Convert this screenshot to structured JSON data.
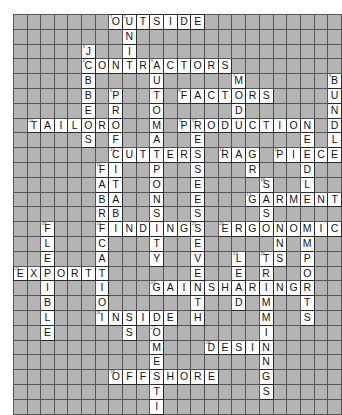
{
  "puzzle": {
    "kind": "crossword-grid",
    "columns": 24,
    "rows": 27,
    "cell_background_empty": "#b4b4b4",
    "cell_background_filled": "#ffffff",
    "grid_line_color": "#56565a",
    "letter_color": "#141414",
    "answers_across": [
      {
        "number": 1,
        "text": "OUTSIDE",
        "row": 0,
        "col": 7
      },
      {
        "number": 4,
        "text": "CONTRACTORS",
        "row": 3,
        "col": 5
      },
      {
        "number": 8,
        "text": "FACTORS",
        "row": 5,
        "col": 10
      },
      {
        "number": 10,
        "text": "TAILOR",
        "row": 7,
        "col": 1
      },
      {
        "number": 11,
        "text": "PRODUCTION",
        "row": 7,
        "col": 12
      },
      {
        "number": 13,
        "text": "CUTTERS",
        "row": 9,
        "col": 8
      },
      {
        "number": 14,
        "text": "RAG",
        "row": 9,
        "col": 16
      },
      {
        "number": 15,
        "text": "PIECE",
        "row": 9,
        "col": 19
      },
      {
        "number": 17,
        "text": "GARMENT",
        "row": 12,
        "col": 17
      },
      {
        "number": 19,
        "text": "FINDINGS",
        "row": 14,
        "col": 6
      },
      {
        "number": 20,
        "text": "ERGONOMICS",
        "row": 14,
        "col": 14
      },
      {
        "number": 22,
        "text": "EXPORT",
        "row": 17,
        "col": 0
      },
      {
        "number": 24,
        "text": "GAINSHARING",
        "row": 19,
        "col": 10
      },
      {
        "number": 26,
        "text": "INSIDE",
        "row": 21,
        "col": 5
      },
      {
        "number": 28,
        "text": "DESIGN",
        "row": 23,
        "col": 13
      },
      {
        "number": 29,
        "text": "OFFSHORE",
        "row": 24,
        "col": 6
      },
      {
        "number": 30,
        "text": "CONSULTANTS",
        "row": 26,
        "col": 8
      }
    ],
    "answers_down": [
      {
        "number": 1,
        "text": "OMA",
        "row": 0,
        "col": 7
      },
      {
        "number": 2,
        "text": "UNIT",
        "row": 0,
        "col": 8
      },
      {
        "number": 3,
        "text": "JOBBERS",
        "row": 2,
        "col": 5
      },
      {
        "number": 5,
        "text": "AUTOMATION",
        "row": 3,
        "col": 10
      },
      {
        "number": 6,
        "text": "PROFITABILITY",
        "row": 5,
        "col": 7
      },
      {
        "number": 7,
        "text": "MODULE",
        "row": 5,
        "col": 14
      },
      {
        "number": 9,
        "text": "BUNDLE",
        "row": 5,
        "col": 23
      },
      {
        "number": 12,
        "text": "RESPONSE",
        "row": 7,
        "col": 13
      },
      {
        "number": 16,
        "text": "SECTION",
        "row": 9,
        "col": 19
      },
      {
        "number": 18,
        "text": "SEAMS",
        "row": 11,
        "col": 18
      },
      {
        "number": 19,
        "text": "FLEXIBLE",
        "row": 14,
        "col": 2
      },
      {
        "number": 21,
        "text": "SEVENTH",
        "row": 14,
        "col": 13
      },
      {
        "number": 23,
        "text": "LEAD",
        "row": 16,
        "col": 11
      },
      {
        "number": 25,
        "text": "TRIMMINGS",
        "row": 16,
        "col": 14
      },
      {
        "number": 27,
        "text": "DOMESTIC",
        "row": 21,
        "col": 10
      }
    ],
    "grid": [
      "       OUTSIDE          ",
      "        N               ",
      "     J  I               ",
      "     CONTRACTORS        ",
      "     B    U       M     ",
      "     B  P T  FACTORS   B",
      "     E  R O       D    U",
      " TAILOR O   PRODUCTION N",
      "     S  F L       E    D",
      "        CUTTERS RAG PIECE",
      "      F I P     S   D   ",
      "      A T O     E   L   ",
      "      B A N   GARMENT   ",
      "      R B S     S       ",
      "  F   I FINDINGS ERGONOMICS",
      "  L   C T      E   N M  O",
      "  E   A Y      V L T S P U",
      "EXPORT         E E R O R ",
      "  I   T   GAINSHARING R C",
      "  B   I      D M     T I ",
      "  L   INSIDE H M     S N ",
      "  E   S   O    I       G ",
      "          M   DESIGN     ",
      "          E    N         ",
      "      OFFSHORE G         ",
      "          T    S         ",
      "          I              ",
      "        CONSULTANTS      "
    ],
    "cells": [
      [
        {
          "c": 7,
          "l": "O",
          "n": "1"
        },
        {
          "c": 8,
          "l": "U",
          "n": "2"
        },
        {
          "c": 9,
          "l": "T"
        },
        {
          "c": 10,
          "l": "S"
        },
        {
          "c": 11,
          "l": "I"
        },
        {
          "c": 12,
          "l": "D"
        },
        {
          "c": 13,
          "l": "E"
        }
      ],
      [
        {
          "c": 8,
          "l": "N"
        }
      ],
      [
        {
          "c": 5,
          "l": "J",
          "n": "3"
        },
        {
          "c": 8,
          "l": "I"
        }
      ],
      [
        {
          "c": 5,
          "l": "C",
          "n": "4"
        },
        {
          "c": 6,
          "l": "O"
        },
        {
          "c": 7,
          "l": "N"
        },
        {
          "c": 8,
          "l": "T"
        },
        {
          "c": 9,
          "l": "R"
        },
        {
          "c": 10,
          "l": "A",
          "n": "5"
        },
        {
          "c": 11,
          "l": "C"
        },
        {
          "c": 12,
          "l": "T"
        },
        {
          "c": 13,
          "l": "O"
        },
        {
          "c": 14,
          "l": "R"
        },
        {
          "c": 15,
          "l": "S"
        }
      ],
      [
        {
          "c": 5,
          "l": "B"
        },
        {
          "c": 10,
          "l": "U"
        },
        {
          "c": 16,
          "l": "M",
          "n": "7"
        },
        {
          "c": 23,
          "l": "B",
          "n": "9"
        }
      ],
      [
        {
          "c": 5,
          "l": "B"
        },
        {
          "c": 7,
          "l": "P",
          "n": "6"
        },
        {
          "c": 10,
          "l": "T"
        },
        {
          "c": 12,
          "l": "F",
          "n": "8"
        },
        {
          "c": 13,
          "l": "A"
        },
        {
          "c": 14,
          "l": "C"
        },
        {
          "c": 15,
          "l": "T"
        },
        {
          "c": 16,
          "l": "O"
        },
        {
          "c": 17,
          "l": "R"
        },
        {
          "c": 18,
          "l": "S"
        },
        {
          "c": 23,
          "l": "U"
        }
      ],
      [
        {
          "c": 5,
          "l": "E"
        },
        {
          "c": 7,
          "l": "R"
        },
        {
          "c": 10,
          "l": "O"
        },
        {
          "c": 16,
          "l": "D"
        },
        {
          "c": 23,
          "l": "N"
        }
      ],
      [
        {
          "c": 1,
          "l": "T",
          "n": "10"
        },
        {
          "c": 2,
          "l": "A"
        },
        {
          "c": 3,
          "l": "I"
        },
        {
          "c": 4,
          "l": "L"
        },
        {
          "c": 5,
          "l": "O"
        },
        {
          "c": 6,
          "l": "R"
        },
        {
          "c": 7,
          "l": "O"
        },
        {
          "c": 10,
          "l": "M"
        },
        {
          "c": 12,
          "l": "P",
          "n": "11"
        },
        {
          "c": 13,
          "l": "R",
          "n": "12"
        },
        {
          "c": 14,
          "l": "O"
        },
        {
          "c": 15,
          "l": "D"
        },
        {
          "c": 16,
          "l": "U"
        },
        {
          "c": 17,
          "l": "C"
        },
        {
          "c": 18,
          "l": "T"
        },
        {
          "c": 19,
          "l": "I"
        },
        {
          "c": 20,
          "l": "O"
        },
        {
          "c": 21,
          "l": "N"
        },
        {
          "c": 23,
          "l": "D"
        }
      ],
      [
        {
          "c": 5,
          "l": "S"
        },
        {
          "c": 7,
          "l": "F"
        },
        {
          "c": 10,
          "l": "A"
        },
        {
          "c": 13,
          "l": "E"
        },
        {
          "c": 21,
          "l": "E"
        },
        {
          "c": 23,
          "l": "L"
        }
      ],
      [
        {
          "c": 7,
          "l": "C",
          "n": "13"
        },
        {
          "c": 8,
          "l": "U"
        },
        {
          "c": 9,
          "l": "T"
        },
        {
          "c": 10,
          "l": "T"
        },
        {
          "c": 11,
          "l": "E"
        },
        {
          "c": 12,
          "l": "R"
        },
        {
          "c": 13,
          "l": "S"
        },
        {
          "c": 15,
          "l": "R",
          "n": "14"
        },
        {
          "c": 16,
          "l": "A"
        },
        {
          "c": 17,
          "l": "G"
        },
        {
          "c": 19,
          "l": "P",
          "n": "15"
        },
        {
          "c": 20,
          "l": "I"
        },
        {
          "c": 21,
          "l": "E"
        },
        {
          "c": 22,
          "l": "C"
        },
        {
          "c": 23,
          "l": "E"
        }
      ],
      [
        {
          "c": 6,
          "l": "F",
          "n": "16"
        },
        {
          "c": 7,
          "l": "I"
        },
        {
          "c": 10,
          "l": "P"
        },
        {
          "c": 13,
          "l": "S"
        },
        {
          "c": 17,
          "l": "R"
        },
        {
          "c": 21,
          "l": "D"
        }
      ],
      [
        {
          "c": 6,
          "l": "A"
        },
        {
          "c": 7,
          "l": "T"
        },
        {
          "c": 10,
          "l": "O"
        },
        {
          "c": 13,
          "l": "E"
        },
        {
          "c": 18,
          "l": "S",
          "n": "18"
        },
        {
          "c": 21,
          "l": "L"
        }
      ],
      [
        {
          "c": 6,
          "l": "B"
        },
        {
          "c": 7,
          "l": "A"
        },
        {
          "c": 10,
          "l": "N"
        },
        {
          "c": 13,
          "l": "E"
        },
        {
          "c": 17,
          "l": "G",
          "n": "17"
        },
        {
          "c": 18,
          "l": "A"
        },
        {
          "c": 19,
          "l": "R"
        },
        {
          "c": 20,
          "l": "M"
        },
        {
          "c": 21,
          "l": "E"
        },
        {
          "c": 22,
          "l": "N"
        },
        {
          "c": 23,
          "l": "T"
        }
      ],
      [
        {
          "c": 6,
          "l": "R"
        },
        {
          "c": 7,
          "l": "B"
        },
        {
          "c": 10,
          "l": "S"
        },
        {
          "c": 13,
          "l": "S"
        },
        {
          "c": 18,
          "l": "S"
        }
      ],
      [
        {
          "c": 2,
          "l": "F",
          "n": "19"
        },
        {
          "c": 6,
          "l": "F",
          "n": "19"
        },
        {
          "c": 7,
          "l": "I"
        },
        {
          "c": 8,
          "l": "N"
        },
        {
          "c": 9,
          "l": "D"
        },
        {
          "c": 10,
          "l": "I"
        },
        {
          "c": 11,
          "l": "N"
        },
        {
          "c": 12,
          "l": "G"
        },
        {
          "c": 13,
          "l": "S",
          "n": "21"
        },
        {
          "c": 15,
          "l": "E",
          "n": "20"
        },
        {
          "c": 16,
          "l": "R"
        },
        {
          "c": 17,
          "l": "G"
        },
        {
          "c": 18,
          "l": "O"
        },
        {
          "c": 19,
          "l": "N"
        },
        {
          "c": 20,
          "l": "O"
        },
        {
          "c": 21,
          "l": "M"
        },
        {
          "c": 22,
          "l": "I"
        },
        {
          "c": 23,
          "l": "C"
        },
        {
          "c": 24,
          "l": "S"
        }
      ],
      [
        {
          "c": 2,
          "l": "L"
        },
        {
          "c": 6,
          "l": "C"
        },
        {
          "c": 10,
          "l": "T"
        },
        {
          "c": 13,
          "l": "E"
        },
        {
          "c": 19,
          "l": "N"
        },
        {
          "c": 21,
          "l": "M"
        },
        {
          "c": 24,
          "l": "O"
        }
      ],
      [
        {
          "c": 2,
          "l": "E"
        },
        {
          "c": 6,
          "l": "A"
        },
        {
          "c": 10,
          "l": "Y"
        },
        {
          "c": 13,
          "l": "V"
        },
        {
          "c": 16,
          "l": "L",
          "n": "23"
        },
        {
          "c": 18,
          "l": "T",
          "n": "25"
        },
        {
          "c": 19,
          "l": "S"
        },
        {
          "c": 21,
          "l": "P"
        },
        {
          "c": 24,
          "l": "U"
        }
      ],
      [
        {
          "c": 0,
          "l": "E",
          "n": "22"
        },
        {
          "c": 1,
          "l": "X"
        },
        {
          "c": 2,
          "l": "P"
        },
        {
          "c": 3,
          "l": "O"
        },
        {
          "c": 4,
          "l": "R"
        },
        {
          "c": 5,
          "l": "T"
        },
        {
          "c": 6,
          "l": "T"
        },
        {
          "c": 13,
          "l": "E"
        },
        {
          "c": 16,
          "l": "E"
        },
        {
          "c": 18,
          "l": "R"
        },
        {
          "c": 21,
          "l": "O"
        },
        {
          "c": 24,
          "l": "R"
        }
      ],
      [
        {
          "c": 2,
          "l": "I"
        },
        {
          "c": 6,
          "l": "I"
        },
        {
          "c": 10,
          "l": "G",
          "n": "24"
        },
        {
          "c": 11,
          "l": "A"
        },
        {
          "c": 12,
          "l": "I"
        },
        {
          "c": 13,
          "l": "N"
        },
        {
          "c": 14,
          "l": "S"
        },
        {
          "c": 15,
          "l": "H"
        },
        {
          "c": 16,
          "l": "A"
        },
        {
          "c": 17,
          "l": "R"
        },
        {
          "c": 18,
          "l": "I"
        },
        {
          "c": 19,
          "l": "N"
        },
        {
          "c": 20,
          "l": "G"
        },
        {
          "c": 21,
          "l": "R"
        },
        {
          "c": 24,
          "l": "C"
        }
      ],
      [
        {
          "c": 2,
          "l": "B"
        },
        {
          "c": 6,
          "l": "O"
        },
        {
          "c": 13,
          "l": "T"
        },
        {
          "c": 16,
          "l": "D"
        },
        {
          "c": 18,
          "l": "M"
        },
        {
          "c": 21,
          "l": "T"
        },
        {
          "c": 24,
          "l": "I"
        }
      ],
      [
        {
          "c": 2,
          "l": "L"
        },
        {
          "c": 6,
          "l": "I",
          "n": "26"
        },
        {
          "c": 7,
          "l": "N"
        },
        {
          "c": 8,
          "l": "S"
        },
        {
          "c": 9,
          "l": "I"
        },
        {
          "c": 10,
          "l": "D"
        },
        {
          "c": 11,
          "l": "E"
        },
        {
          "c": 13,
          "l": "H"
        },
        {
          "c": 18,
          "l": "M"
        },
        {
          "c": 21,
          "l": "S"
        },
        {
          "c": 24,
          "l": "N"
        }
      ],
      [
        {
          "c": 2,
          "l": "E"
        },
        {
          "c": 8,
          "l": "S"
        },
        {
          "c": 10,
          "l": "O",
          "n": "27"
        },
        {
          "c": 18,
          "l": "I"
        },
        {
          "c": 24,
          "l": "G"
        }
      ],
      [
        {
          "c": 10,
          "l": "M"
        },
        {
          "c": 14,
          "l": "D",
          "n": "28"
        },
        {
          "c": 15,
          "l": "E"
        },
        {
          "c": 16,
          "l": "S"
        },
        {
          "c": 17,
          "l": "I"
        },
        {
          "c": 18,
          "l": "G"
        },
        {
          "c": 18,
          "l": "N"
        }
      ],
      [
        {
          "c": 10,
          "l": "E"
        },
        {
          "c": 18,
          "l": "N"
        }
      ],
      [
        {
          "c": 7,
          "l": "O",
          "n": "29"
        },
        {
          "c": 8,
          "l": "F"
        },
        {
          "c": 9,
          "l": "F"
        },
        {
          "c": 10,
          "l": "S"
        },
        {
          "c": 11,
          "l": "H"
        },
        {
          "c": 12,
          "l": "O"
        },
        {
          "c": 13,
          "l": "R"
        },
        {
          "c": 14,
          "l": "E"
        },
        {
          "c": 18,
          "l": "G"
        }
      ],
      [
        {
          "c": 10,
          "l": "T"
        },
        {
          "c": 18,
          "l": "S"
        }
      ],
      [
        {
          "c": 10,
          "l": "I"
        }
      ],
      [
        {
          "c": 10,
          "l": "C",
          "n": "30"
        },
        {
          "c": 11,
          "l": "O"
        },
        {
          "c": 12,
          "l": "N"
        },
        {
          "c": 13,
          "l": "S"
        },
        {
          "c": 14,
          "l": "U"
        },
        {
          "c": 15,
          "l": "L"
        },
        {
          "c": 16,
          "l": "T"
        },
        {
          "c": 17,
          "l": "A"
        },
        {
          "c": 18,
          "l": "N"
        },
        {
          "c": 19,
          "l": "T"
        },
        {
          "c": 20,
          "l": "S"
        }
      ]
    ]
  }
}
